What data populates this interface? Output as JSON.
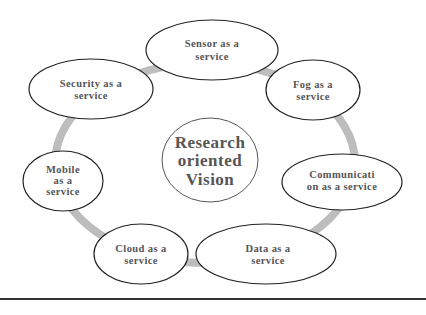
{
  "diagram": {
    "center": {
      "lines": [
        "Research",
        "oriented",
        "Vision"
      ]
    },
    "nodes": [
      {
        "id": "sensor",
        "lines": [
          "Sensor as a",
          "service"
        ]
      },
      {
        "id": "fog",
        "lines": [
          "Fog as a",
          "service"
        ]
      },
      {
        "id": "communication",
        "lines": [
          "Communicati",
          "on as a service"
        ]
      },
      {
        "id": "data",
        "lines": [
          "Data as a",
          "service"
        ]
      },
      {
        "id": "cloud",
        "lines": [
          "Cloud as a",
          "service"
        ]
      },
      {
        "id": "mobile",
        "lines": [
          "Mobile",
          "as a",
          "service"
        ]
      },
      {
        "id": "security",
        "lines": [
          "Security as a",
          "service"
        ]
      }
    ],
    "colors": {
      "ring": "#bdbdbd",
      "ellipse_stroke": "#222222",
      "text": "#555555",
      "rule": "#333333"
    }
  }
}
